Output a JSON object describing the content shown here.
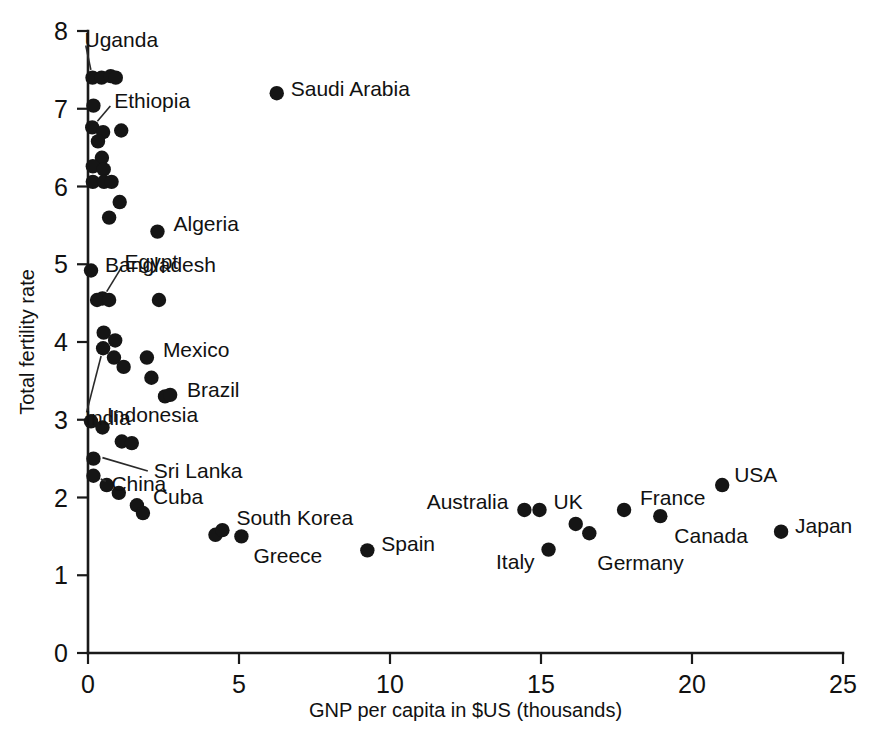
{
  "chart_data": {
    "type": "scatter",
    "title": "",
    "xlabel": "GNP per capita in $US (thousands)",
    "ylabel": "Total fertility rate",
    "xlim": [
      0,
      25
    ],
    "ylim": [
      0,
      8
    ],
    "xticks": [
      0,
      5,
      10,
      15,
      20,
      25
    ],
    "yticks": [
      0,
      1,
      2,
      3,
      4,
      5,
      6,
      7,
      8
    ],
    "xtick_labels": [
      "0",
      "5",
      "10",
      "15",
      "20",
      "25"
    ],
    "ytick_labels": [
      "0",
      "1",
      "2",
      "3",
      "4",
      "5",
      "6",
      "7",
      "8"
    ],
    "grid": false,
    "legend": "none",
    "marker": "filled-circle",
    "marker_color": "#151515",
    "points": [
      {
        "label": "Uganda",
        "x": 0.15,
        "y": 7.4,
        "labeled": true,
        "label_dx": -8,
        "label_dy": -38,
        "anchor": "start",
        "leader": true
      },
      {
        "label": "",
        "x": 0.45,
        "y": 7.4,
        "labeled": false
      },
      {
        "label": "",
        "x": 0.75,
        "y": 7.42,
        "labeled": false
      },
      {
        "label": "",
        "x": 0.92,
        "y": 7.4,
        "labeled": false
      },
      {
        "label": "",
        "x": 0.18,
        "y": 7.04,
        "labeled": false
      },
      {
        "label": "Ethiopia",
        "x": 0.14,
        "y": 6.76,
        "labeled": true,
        "label_dx": 22,
        "label_dy": -26,
        "anchor": "start",
        "leader": true
      },
      {
        "label": "",
        "x": 0.5,
        "y": 6.7,
        "labeled": false
      },
      {
        "label": "",
        "x": 1.1,
        "y": 6.72,
        "labeled": false
      },
      {
        "label": "",
        "x": 0.33,
        "y": 6.58,
        "labeled": false
      },
      {
        "label": "",
        "x": 0.46,
        "y": 6.37,
        "labeled": false
      },
      {
        "label": "",
        "x": 0.16,
        "y": 6.26,
        "labeled": false
      },
      {
        "label": "",
        "x": 0.52,
        "y": 6.22,
        "labeled": false
      },
      {
        "label": "",
        "x": 0.16,
        "y": 6.06,
        "labeled": false
      },
      {
        "label": "",
        "x": 0.53,
        "y": 6.06,
        "labeled": false
      },
      {
        "label": "",
        "x": 0.78,
        "y": 6.06,
        "labeled": false
      },
      {
        "label": "",
        "x": 1.05,
        "y": 5.8,
        "labeled": false
      },
      {
        "label": "",
        "x": 0.7,
        "y": 5.6,
        "labeled": false
      },
      {
        "label": "Algeria",
        "x": 2.3,
        "y": 5.42,
        "labeled": true,
        "label_dx": 16,
        "label_dy": -8,
        "anchor": "start",
        "leader": false
      },
      {
        "label": "Bangladesh",
        "x": 0.1,
        "y": 4.92,
        "labeled": true,
        "label_dx": 14,
        "label_dy": -5,
        "anchor": "start",
        "leader": false
      },
      {
        "label": "Egypt",
        "x": 0.48,
        "y": 4.56,
        "labeled": true,
        "label_dx": 22,
        "label_dy": -36,
        "anchor": "start",
        "leader": true
      },
      {
        "label": "",
        "x": 0.3,
        "y": 4.54,
        "labeled": false
      },
      {
        "label": "",
        "x": 0.7,
        "y": 4.54,
        "labeled": false
      },
      {
        "label": "",
        "x": 2.35,
        "y": 4.54,
        "labeled": false
      },
      {
        "label": "",
        "x": 0.52,
        "y": 4.12,
        "labeled": false
      },
      {
        "label": "",
        "x": 0.9,
        "y": 4.02,
        "labeled": false
      },
      {
        "label": "India",
        "x": 0.5,
        "y": 3.92,
        "labeled": true,
        "label_dx": -18,
        "label_dy": 70,
        "anchor": "start",
        "leader": true
      },
      {
        "label": "",
        "x": 0.86,
        "y": 3.8,
        "labeled": false
      },
      {
        "label": "Mexico",
        "x": 1.95,
        "y": 3.8,
        "labeled": true,
        "label_dx": 16,
        "label_dy": -8,
        "anchor": "start",
        "leader": false
      },
      {
        "label": "",
        "x": 1.18,
        "y": 3.68,
        "labeled": false
      },
      {
        "label": "",
        "x": 2.1,
        "y": 3.54,
        "labeled": false
      },
      {
        "label": "Brazil",
        "x": 2.55,
        "y": 3.3,
        "labeled": true,
        "label_dx": 22,
        "label_dy": -6,
        "anchor": "start",
        "leader": false
      },
      {
        "label": "",
        "x": 2.72,
        "y": 3.32,
        "labeled": false
      },
      {
        "label": "Indonesia",
        "x": 0.1,
        "y": 2.98,
        "labeled": true,
        "label_dx": 16,
        "label_dy": -6,
        "anchor": "start",
        "leader": false
      },
      {
        "label": "",
        "x": 0.48,
        "y": 2.9,
        "labeled": false
      },
      {
        "label": "",
        "x": 1.12,
        "y": 2.72,
        "labeled": false
      },
      {
        "label": "Sri Lanka",
        "x": 1.45,
        "y": 2.7,
        "labeled": true,
        "label_dx": 0,
        "label_dy": 0,
        "anchor": "start",
        "leader": false
      },
      {
        "label": "",
        "x": 0.18,
        "y": 2.5,
        "labeled": false
      },
      {
        "label": "China",
        "x": 0.18,
        "y": 2.28,
        "labeled": true,
        "label_dx": 18,
        "label_dy": 8,
        "anchor": "start",
        "leader": true
      },
      {
        "label": "",
        "x": 0.62,
        "y": 2.16,
        "labeled": false
      },
      {
        "label": "",
        "x": 1.02,
        "y": 2.06,
        "labeled": false
      },
      {
        "label": "Cuba",
        "x": 1.62,
        "y": 1.9,
        "labeled": true,
        "label_dx": 16,
        "label_dy": -8,
        "anchor": "start",
        "leader": false
      },
      {
        "label": "",
        "x": 1.82,
        "y": 1.8,
        "labeled": false
      },
      {
        "label": "",
        "x": 4.22,
        "y": 1.52,
        "labeled": false
      },
      {
        "label": "South Korea",
        "x": 4.45,
        "y": 1.58,
        "labeled": true,
        "label_dx": 14,
        "label_dy": -12,
        "anchor": "start",
        "leader": false
      },
      {
        "label": "Greece",
        "x": 5.08,
        "y": 1.5,
        "labeled": true,
        "label_dx": 12,
        "label_dy": 20,
        "anchor": "start",
        "leader": false
      },
      {
        "label": "Spain",
        "x": 9.25,
        "y": 1.32,
        "labeled": true,
        "label_dx": 14,
        "label_dy": -6,
        "anchor": "start",
        "leader": false
      },
      {
        "label": "Australia",
        "x": 14.45,
        "y": 1.84,
        "labeled": true,
        "label_dx": -16,
        "label_dy": -8,
        "anchor": "end",
        "leader": false
      },
      {
        "label": "UK",
        "x": 14.95,
        "y": 1.84,
        "labeled": true,
        "label_dx": 14,
        "label_dy": -8,
        "anchor": "start",
        "leader": false
      },
      {
        "label": "Italy",
        "x": 15.25,
        "y": 1.33,
        "labeled": true,
        "label_dx": -14,
        "label_dy": 12,
        "anchor": "end",
        "leader": false
      },
      {
        "label": "",
        "x": 16.15,
        "y": 1.66,
        "labeled": false
      },
      {
        "label": "Germany",
        "x": 16.6,
        "y": 1.54,
        "labeled": true,
        "label_dx": 8,
        "label_dy": 30,
        "anchor": "start",
        "leader": false
      },
      {
        "label": "France",
        "x": 17.75,
        "y": 1.84,
        "labeled": true,
        "label_dx": 16,
        "label_dy": -12,
        "anchor": "start",
        "leader": false
      },
      {
        "label": "Canada",
        "x": 18.95,
        "y": 1.76,
        "labeled": true,
        "label_dx": 14,
        "label_dy": 20,
        "anchor": "start",
        "leader": false
      },
      {
        "label": "USA",
        "x": 21.0,
        "y": 2.16,
        "labeled": true,
        "label_dx": 12,
        "label_dy": -10,
        "anchor": "start",
        "leader": false
      },
      {
        "label": "Japan",
        "x": 22.95,
        "y": 1.56,
        "labeled": true,
        "label_dx": 14,
        "label_dy": -6,
        "anchor": "start",
        "leader": false
      },
      {
        "label": "Saudi Arabia",
        "x": 6.25,
        "y": 7.2,
        "labeled": true,
        "label_dx": 14,
        "label_dy": -4,
        "anchor": "start",
        "leader": false
      }
    ]
  }
}
